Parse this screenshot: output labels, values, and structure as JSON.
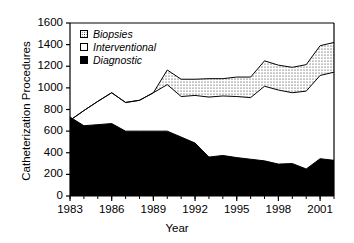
{
  "chart_data": {
    "type": "area",
    "title": "",
    "subtitle": "",
    "xlabel": "Year",
    "ylabel": "Catheterization Procedures",
    "xlim": [
      1983,
      2002
    ],
    "ylim": [
      0,
      1600
    ],
    "ytick_labels": [
      "0",
      "200",
      "400",
      "600",
      "800",
      "1000",
      "1200",
      "1400",
      "1600"
    ],
    "ytick_values": [
      0,
      200,
      400,
      600,
      800,
      1000,
      1200,
      1400,
      1600
    ],
    "xtick_labels": [
      "1983",
      "1986",
      "1989",
      "1992",
      "1995",
      "1998",
      "2001"
    ],
    "xtick_values": [
      1983,
      1986,
      1989,
      1992,
      1995,
      1998,
      2001
    ],
    "grid": false,
    "stacked": true,
    "legend_position": "top-left",
    "x": [
      1983,
      1984,
      1985,
      1986,
      1987,
      1988,
      1989,
      1990,
      1991,
      1992,
      1993,
      1994,
      1995,
      1996,
      1997,
      1998,
      1999,
      2000,
      2001,
      2002
    ],
    "series": [
      {
        "name": "Diagnostic",
        "fill": "solid-black",
        "color": "#000000",
        "values": [
          730,
          650,
          660,
          670,
          600,
          600,
          600,
          600,
          545,
          490,
          360,
          375,
          355,
          340,
          325,
          295,
          300,
          250,
          345,
          330
        ]
      },
      {
        "name": "Interventional",
        "fill": "white",
        "color": "#ffffff",
        "values": [
          -30,
          140,
          215,
          285,
          265,
          285,
          355,
          430,
          375,
          440,
          555,
          550,
          565,
          570,
          690,
          685,
          655,
          720,
          770,
          815
        ]
      },
      {
        "name": "Biopsies",
        "fill": "stipple",
        "color": "#ffffff",
        "values": [
          0,
          0,
          0,
          0,
          0,
          0,
          0,
          135,
          160,
          150,
          170,
          160,
          180,
          190,
          235,
          230,
          235,
          245,
          275,
          275
        ]
      }
    ],
    "cumulative_top_line": [
      700,
      790,
      875,
      955,
      865,
      885,
      955,
      1165,
      1080,
      1080,
      1085,
      1085,
      1100,
      1100,
      1250,
      1210,
      1190,
      1215,
      1390,
      1420
    ],
    "diagnostic_top_line": [
      730,
      650,
      660,
      670,
      600,
      600,
      600,
      600,
      545,
      490,
      360,
      375,
      355,
      340,
      325,
      295,
      300,
      250,
      345,
      330
    ],
    "interventional_top_line": [
      700,
      790,
      875,
      955,
      865,
      885,
      955,
      1030,
      920,
      930,
      915,
      925,
      920,
      910,
      1015,
      980,
      955,
      970,
      1115,
      1145
    ],
    "annotations": [
      {
        "label": "1990 peak",
        "x": 1990,
        "y": 1360
      }
    ]
  },
  "legend": {
    "items": [
      {
        "label": "Biopsies",
        "swatch": "stipple"
      },
      {
        "label": "Interventional",
        "swatch": "white"
      },
      {
        "label": "Diagnostic",
        "swatch": "solid"
      }
    ]
  }
}
